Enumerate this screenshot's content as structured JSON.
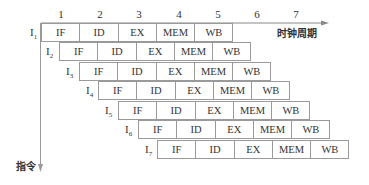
{
  "diagram": {
    "type": "instruction-pipeline-timing",
    "x_axis_label": "时钟周期",
    "y_axis_label": "指令",
    "clock_cycles": [
      "1",
      "2",
      "3",
      "4",
      "5",
      "6",
      "7"
    ],
    "stages": [
      "IF",
      "ID",
      "EX",
      "MEM",
      "WB"
    ],
    "instructions": [
      {
        "label": "I",
        "sub": "1",
        "start_cycle": 1,
        "stages": [
          "IF",
          "ID",
          "EX",
          "MEM",
          "WB"
        ]
      },
      {
        "label": "I",
        "sub": "2",
        "start_cycle": 1.5,
        "stages": [
          "IF",
          "ID",
          "EX",
          "MEM",
          "WB"
        ]
      },
      {
        "label": "I",
        "sub": "3",
        "start_cycle": 2,
        "stages": [
          "IF",
          "ID",
          "EX",
          "MEM",
          "WB"
        ]
      },
      {
        "label": "I",
        "sub": "4",
        "start_cycle": 2.5,
        "stages": [
          "IF",
          "ID",
          "EX",
          "MEM",
          "WB"
        ]
      },
      {
        "label": "I",
        "sub": "5",
        "start_cycle": 3,
        "stages": [
          "IF",
          "ID",
          "EX",
          "MEM",
          "WB"
        ]
      },
      {
        "label": "I",
        "sub": "6",
        "start_cycle": 3.5,
        "stages": [
          "IF",
          "ID",
          "EX",
          "MEM",
          "WB"
        ]
      },
      {
        "label": "I",
        "sub": "7",
        "start_cycle": 4,
        "stages": [
          "IF",
          "ID",
          "EX",
          "MEM",
          "WB"
        ]
      }
    ]
  }
}
